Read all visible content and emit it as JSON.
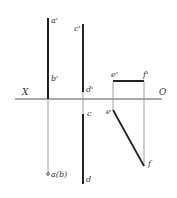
{
  "diagram": {
    "type": "orthographic projection",
    "axis": {
      "left_label": "X",
      "right_label": "O"
    },
    "labels": {
      "a_prime": "a'",
      "b_prime": "b'",
      "c_prime": "c'",
      "d_prime": "d'",
      "c": "c",
      "d": "d",
      "ab": "a(b)",
      "e_prime": "e'",
      "f_prime": "f'",
      "e": "e",
      "f": "f"
    },
    "colors": {
      "line": "#222222",
      "thin_line": "#888888",
      "text": "#333333"
    }
  }
}
